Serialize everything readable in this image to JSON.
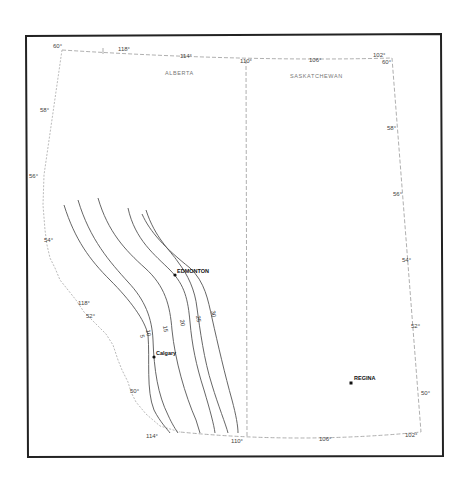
{
  "map": {
    "provinces": [
      {
        "name": "ALBERTA",
        "x": 165,
        "y": 75
      },
      {
        "name": "SASKATCHEWAN",
        "x": 305,
        "y": 78
      }
    ],
    "cities": [
      {
        "name": "EDMONTON",
        "x": 175,
        "y": 275,
        "lx": 177,
        "ly": 273
      },
      {
        "name": "Calgary",
        "x": 154,
        "y": 357,
        "lx": 156,
        "ly": 355
      },
      {
        "name": "REGINA",
        "x": 351,
        "y": 383,
        "lx": 353,
        "ly": 380
      }
    ],
    "longitude_ticks_top": [
      {
        "label": "60°",
        "x": 53,
        "y": 48
      },
      {
        "label": "118°",
        "x": 118,
        "y": 51
      },
      {
        "label": "114°",
        "x": 180,
        "y": 58
      },
      {
        "label": "110°",
        "x": 245,
        "y": 63
      },
      {
        "label": "106°",
        "x": 312,
        "y": 62
      },
      {
        "label": "102°",
        "x": 373,
        "y": 57
      },
      {
        "label": "60°",
        "x": 380,
        "y": 63
      }
    ],
    "latitude_ticks_left": [
      {
        "label": "58°",
        "x": 40,
        "y": 112
      },
      {
        "label": "56°",
        "x": 29,
        "y": 178
      },
      {
        "label": "54°",
        "x": 44,
        "y": 242
      },
      {
        "label": "118°",
        "x": 78,
        "y": 305
      },
      {
        "label": "52°",
        "x": 86,
        "y": 318
      },
      {
        "label": "50°",
        "x": 130,
        "y": 393
      }
    ],
    "latitude_ticks_right": [
      {
        "label": "58°",
        "x": 387,
        "y": 130
      },
      {
        "label": "56°",
        "x": 393,
        "y": 196
      },
      {
        "label": "54°",
        "x": 402,
        "y": 262
      },
      {
        "label": "52°",
        "x": 411,
        "y": 328
      },
      {
        "label": "50°",
        "x": 421,
        "y": 395
      }
    ],
    "longitude_ticks_bottom": [
      {
        "label": "114°",
        "x": 146,
        "y": 436
      },
      {
        "label": "110°",
        "x": 231,
        "y": 442
      },
      {
        "label": "106°",
        "x": 319,
        "y": 440
      },
      {
        "label": "102°",
        "x": 405,
        "y": 436
      }
    ],
    "contours": [
      {
        "value": "5",
        "label_x": 140,
        "label_y": 335
      },
      {
        "value": "10",
        "label_x": 146,
        "label_y": 330
      },
      {
        "value": "15",
        "label_x": 163,
        "label_y": 326
      },
      {
        "value": "20",
        "label_x": 180,
        "label_y": 320
      },
      {
        "value": "25",
        "label_x": 196,
        "label_y": 316
      },
      {
        "value": "30",
        "label_x": 211,
        "label_y": 311
      }
    ]
  }
}
